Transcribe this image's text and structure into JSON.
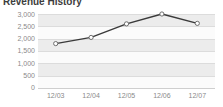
{
  "widget": {
    "title": "Revenue History",
    "background_color": "#ffffff",
    "band_color": "#ececec",
    "gridline_color": "#dcdcdc",
    "tick_label_color": "#8a8a8a",
    "title_color": "#3d3d3d"
  },
  "chart_data": {
    "type": "line",
    "title": "Revenue History",
    "xlabel": "",
    "ylabel": "",
    "categories": [
      "12/03",
      "12/04",
      "12/05",
      "12/06",
      "12/07"
    ],
    "values": [
      1800,
      2050,
      2600,
      3000,
      2620
    ],
    "series": [
      {
        "name": "Revenue",
        "values": [
          1800,
          2050,
          2600,
          3000,
          2620
        ],
        "line_color": "#3a3a3a",
        "marker_fill": "#ffffff",
        "marker_stroke": "#6e6e6e"
      }
    ],
    "ylim": [
      0,
      3000
    ],
    "ytick_labels": [
      "3,000",
      "2,500",
      "2,000",
      "1,500",
      "1,000",
      "500",
      "0"
    ],
    "ytick_values": [
      3000,
      2500,
      2000,
      1500,
      1000,
      500,
      0
    ],
    "xtick_labels": [
      "12/03",
      "12/04",
      "12/05",
      "12/06",
      "12/07"
    ],
    "grid": true,
    "grid_axis": "y",
    "alternating_bands": true,
    "legend": false,
    "legend_position": "none",
    "markers": "open-circle"
  }
}
